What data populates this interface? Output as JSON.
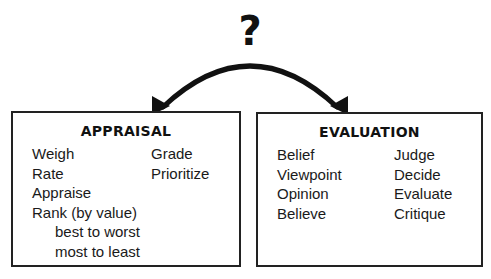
{
  "diagram": {
    "question_symbol": "?",
    "connector": {
      "type": "double-headed curved arrow",
      "from": "appraisal",
      "to": "evaluation"
    },
    "boxes": {
      "appraisal": {
        "title": "APPRAISAL",
        "column_1": [
          {
            "text": "Weigh",
            "indent": false
          },
          {
            "text": "Rate",
            "indent": false
          },
          {
            "text": "Appraise",
            "indent": false
          },
          {
            "text": "Rank (by value)",
            "indent": false
          },
          {
            "text": "best to worst",
            "indent": true
          },
          {
            "text": "most to least",
            "indent": true
          }
        ],
        "column_2": [
          {
            "text": "Grade"
          },
          {
            "text": "Prioritize"
          }
        ]
      },
      "evaluation": {
        "title": "EVALUATION",
        "column_1": [
          {
            "text": "Belief"
          },
          {
            "text": "Viewpoint"
          },
          {
            "text": "Opinion"
          },
          {
            "text": "Believe"
          }
        ],
        "column_2": [
          {
            "text": "Judge"
          },
          {
            "text": "Decide"
          },
          {
            "text": "Evaluate"
          },
          {
            "text": "Critique"
          }
        ]
      }
    },
    "colors": {
      "ink": "#111111",
      "border": "#222222",
      "background": "#ffffff"
    }
  }
}
